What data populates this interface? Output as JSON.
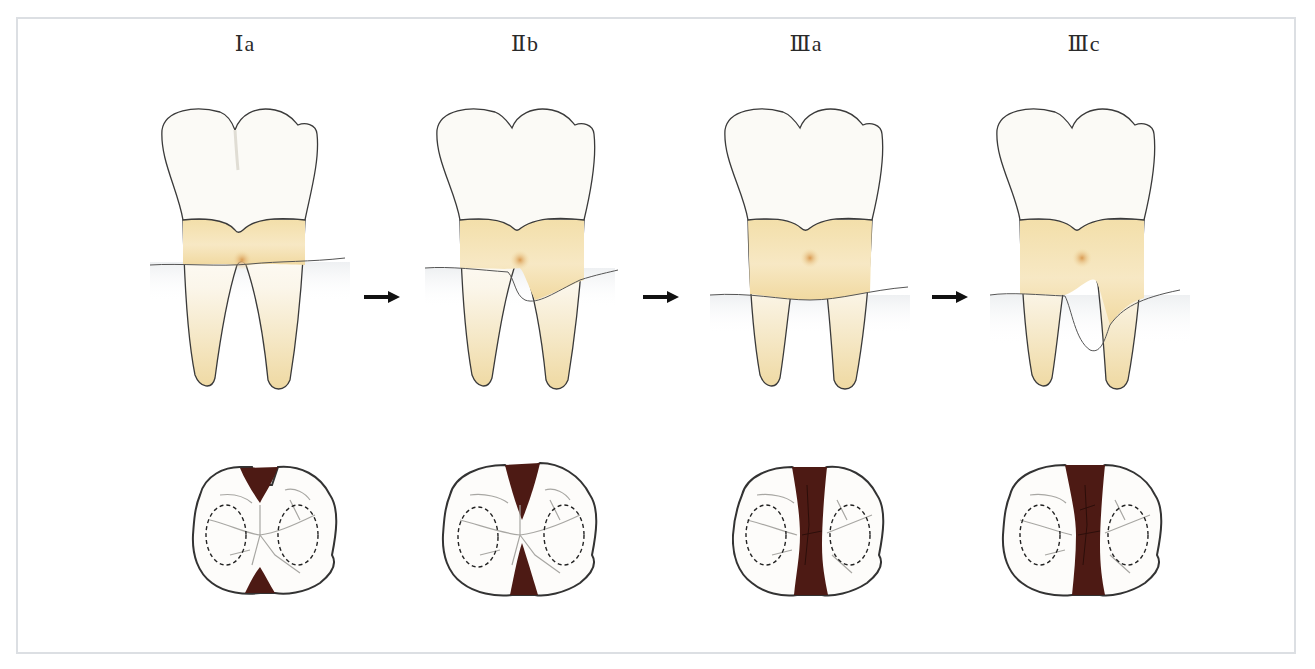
{
  "diagram": {
    "type": "dental furcation involvement progression",
    "stages": [
      {
        "label": "Ⅰa",
        "bone_level": "cervical",
        "furcation": "incipient"
      },
      {
        "label": "Ⅱb",
        "bone_level": "partial",
        "furcation": "partial"
      },
      {
        "label": "Ⅲa",
        "bone_level": "through-and-through",
        "furcation": "through"
      },
      {
        "label": "Ⅲc",
        "bone_level": "deep",
        "furcation": "through"
      }
    ],
    "arrows": [
      "→",
      "→",
      "→"
    ],
    "colors": {
      "enamel": "#fbfaf6",
      "root": "#f3dfaa",
      "root_highlight": "#fbf1d6",
      "outline": "#3a3a3a",
      "furcation_defect": "#4d1a14",
      "bone_shading": "#f1f2f3",
      "frame_border": "#dcdfe3"
    }
  }
}
